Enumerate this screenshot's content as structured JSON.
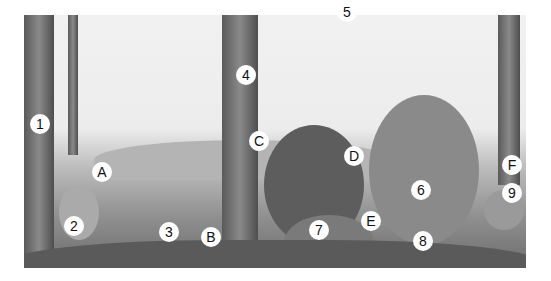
{
  "illustration": {
    "description": "Pencil drawing of a forest scene with animals",
    "labels": [
      {
        "id": "1",
        "subject": "woodpecker",
        "x": 40,
        "y": 124
      },
      {
        "id": "2",
        "subject": "rabbit",
        "x": 74,
        "y": 226
      },
      {
        "id": "3",
        "subject": "robin",
        "x": 169,
        "y": 232
      },
      {
        "id": "4",
        "subject": "squirrel",
        "x": 246,
        "y": 75
      },
      {
        "id": "5",
        "subject": "tits",
        "x": 347,
        "y": 12
      },
      {
        "id": "6",
        "subject": "fox",
        "x": 421,
        "y": 190
      },
      {
        "id": "7",
        "subject": "hedgehog",
        "x": 319,
        "y": 230
      },
      {
        "id": "8",
        "subject": "lizard",
        "x": 423,
        "y": 241
      },
      {
        "id": "9",
        "subject": "mouse",
        "x": 512,
        "y": 193
      },
      {
        "id": "A",
        "subject": "hill",
        "x": 102,
        "y": 172
      },
      {
        "id": "B",
        "subject": "plants",
        "x": 211,
        "y": 237
      },
      {
        "id": "C",
        "subject": "tree",
        "x": 259,
        "y": 141
      },
      {
        "id": "D",
        "subject": "bushes",
        "x": 354,
        "y": 156
      },
      {
        "id": "E",
        "subject": "stump",
        "x": 371,
        "y": 221
      },
      {
        "id": "F",
        "subject": "tree",
        "x": 512,
        "y": 165
      }
    ]
  }
}
